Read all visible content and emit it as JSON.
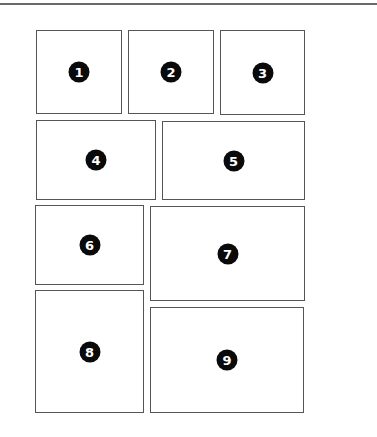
{
  "layout_title": "",
  "panels": [
    {
      "id": 1,
      "label": "1",
      "x": 36,
      "y": 30,
      "w": 86,
      "h": 84
    },
    {
      "id": 2,
      "label": "2",
      "x": 128,
      "y": 30,
      "w": 86,
      "h": 84
    },
    {
      "id": 3,
      "label": "3",
      "x": 220,
      "y": 30,
      "w": 85,
      "h": 85
    },
    {
      "id": 4,
      "label": "4",
      "x": 36,
      "y": 120,
      "w": 120,
      "h": 80
    },
    {
      "id": 5,
      "label": "5",
      "x": 162,
      "y": 121,
      "w": 143,
      "h": 79
    },
    {
      "id": 6,
      "label": "6",
      "x": 35,
      "y": 205,
      "w": 109,
      "h": 80
    },
    {
      "id": 7,
      "label": "7",
      "x": 150,
      "y": 206,
      "w": 155,
      "h": 95
    },
    {
      "id": 8,
      "label": "8",
      "x": 35,
      "y": 290,
      "w": 109,
      "h": 123
    },
    {
      "id": 9,
      "label": "9",
      "x": 150,
      "y": 307,
      "w": 154,
      "h": 106
    }
  ],
  "colors": {
    "border": "#555555",
    "badge": "#0a0a0a",
    "badge_text": "#ffffff",
    "rule": "#6a6a6a"
  }
}
